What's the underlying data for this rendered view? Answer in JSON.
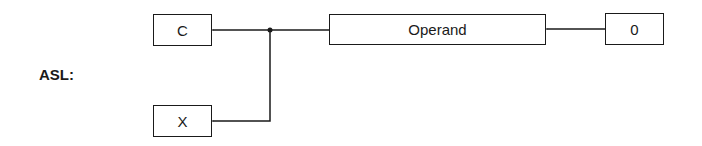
{
  "diagram": {
    "instruction_label": "ASL:",
    "boxes": {
      "carry": "C",
      "x": "X",
      "operand": "Operand",
      "zero": "0"
    },
    "connections": [
      {
        "from": "zero",
        "to": "operand"
      },
      {
        "from": "operand",
        "to": "carry"
      },
      {
        "from": "operand",
        "to": "x"
      }
    ]
  }
}
